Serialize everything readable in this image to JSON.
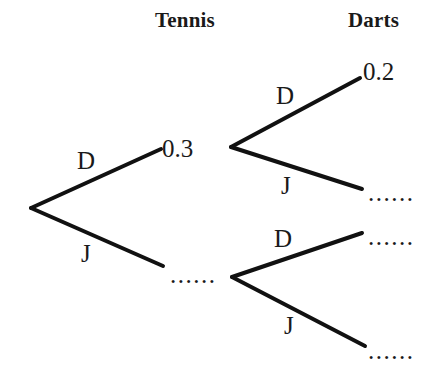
{
  "diagram": {
    "type": "probability-tree",
    "background_color": "#ffffff",
    "stroke_color": "#111111",
    "headers": [
      {
        "label": "Tennis",
        "x": 155,
        "y": 8
      },
      {
        "label": "Darts",
        "x": 348,
        "y": 8
      }
    ],
    "branches": [
      {
        "id": "root-d",
        "label": "D",
        "label_x": 77,
        "label_y": 148,
        "from": "root",
        "to": "tennis-win"
      },
      {
        "id": "root-j",
        "label": "J",
        "label_x": 81,
        "label_y": 241,
        "from": "root",
        "to": "tennis-lose"
      },
      {
        "id": "top-d",
        "label": "D",
        "label_x": 276,
        "label_y": 83,
        "from": "tennis-win",
        "to": "darts-win-1"
      },
      {
        "id": "top-j",
        "label": "J",
        "label_x": 281,
        "label_y": 173,
        "from": "tennis-win",
        "to": "darts-lose-1"
      },
      {
        "id": "bottom-d",
        "label": "D",
        "label_x": 274,
        "label_y": 226,
        "from": "tennis-lose",
        "to": "darts-win-2"
      },
      {
        "id": "bottom-j",
        "label": "J",
        "label_x": 284,
        "label_y": 313,
        "from": "tennis-lose",
        "to": "darts-lose-2"
      }
    ],
    "probabilities": [
      {
        "id": "p-tennis-d",
        "value": "0.3",
        "x": 162,
        "y": 136,
        "known": true
      },
      {
        "id": "p-tennis-j",
        "value": "......",
        "x": 170,
        "y": 262,
        "known": false
      },
      {
        "id": "p-darts-d1",
        "value": "0.2",
        "x": 363,
        "y": 59,
        "known": true
      },
      {
        "id": "p-darts-j1",
        "value": "......",
        "x": 368,
        "y": 180,
        "known": false
      },
      {
        "id": "p-darts-d2",
        "value": "......",
        "x": 368,
        "y": 224,
        "known": false
      },
      {
        "id": "p-darts-j2",
        "value": "......",
        "x": 368,
        "y": 338,
        "known": false
      }
    ],
    "lines": [
      {
        "id": "line-root-d",
        "x1": 31,
        "y1": 208,
        "x2": 161,
        "y2": 149
      },
      {
        "id": "line-root-j",
        "x1": 31,
        "y1": 208,
        "x2": 163,
        "y2": 266
      },
      {
        "id": "line-top-d",
        "x1": 231,
        "y1": 147,
        "x2": 360,
        "y2": 78
      },
      {
        "id": "line-top-j",
        "x1": 231,
        "y1": 147,
        "x2": 362,
        "y2": 189
      },
      {
        "id": "line-bottom-d",
        "x1": 232,
        "y1": 277,
        "x2": 362,
        "y2": 233
      },
      {
        "id": "line-bottom-j",
        "x1": 232,
        "y1": 277,
        "x2": 365,
        "y2": 346
      }
    ]
  }
}
